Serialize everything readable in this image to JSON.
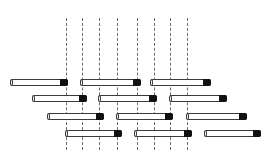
{
  "diagram": {
    "colors": {
      "bar_body": "#ffffff",
      "bar_outline": "#3a3a3a",
      "bar_cap": "#111111",
      "dashed_line": "#6b6b6b",
      "background": "#ffffff"
    },
    "dashed_lines": {
      "y_top": 18,
      "y_bottom": 150,
      "x": [
        66,
        82,
        99,
        117,
        137,
        154,
        170,
        187
      ]
    },
    "rows": [
      {
        "y": 79,
        "bars": [
          {
            "x1": 10,
            "x2": 68
          },
          {
            "x1": 80,
            "x2": 141
          },
          {
            "x1": 150,
            "x2": 211
          }
        ]
      },
      {
        "y": 95,
        "bars": [
          {
            "x1": 32,
            "x2": 87
          },
          {
            "x1": 98,
            "x2": 157
          },
          {
            "x1": 169,
            "x2": 227
          }
        ]
      },
      {
        "y": 113,
        "bars": [
          {
            "x1": 47,
            "x2": 104
          },
          {
            "x1": 116,
            "x2": 173
          },
          {
            "x1": 186,
            "x2": 247
          }
        ]
      },
      {
        "y": 130,
        "bars": [
          {
            "x1": 65,
            "x2": 122
          },
          {
            "x1": 134,
            "x2": 192
          },
          {
            "x1": 204,
            "x2": 261
          }
        ]
      }
    ]
  }
}
